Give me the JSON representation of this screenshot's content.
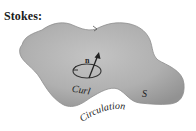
{
  "figure": {
    "title": "Stokes:",
    "labels": {
      "normal": "n",
      "curl": "Curl",
      "surface": "S",
      "circulation": "Circulation"
    },
    "colors": {
      "surface_fill": "#a8a8a8",
      "surface_highlight": "#c6c6c6",
      "outline": "#8a8a8a",
      "text": "#222222",
      "background": "#ffffff"
    }
  }
}
